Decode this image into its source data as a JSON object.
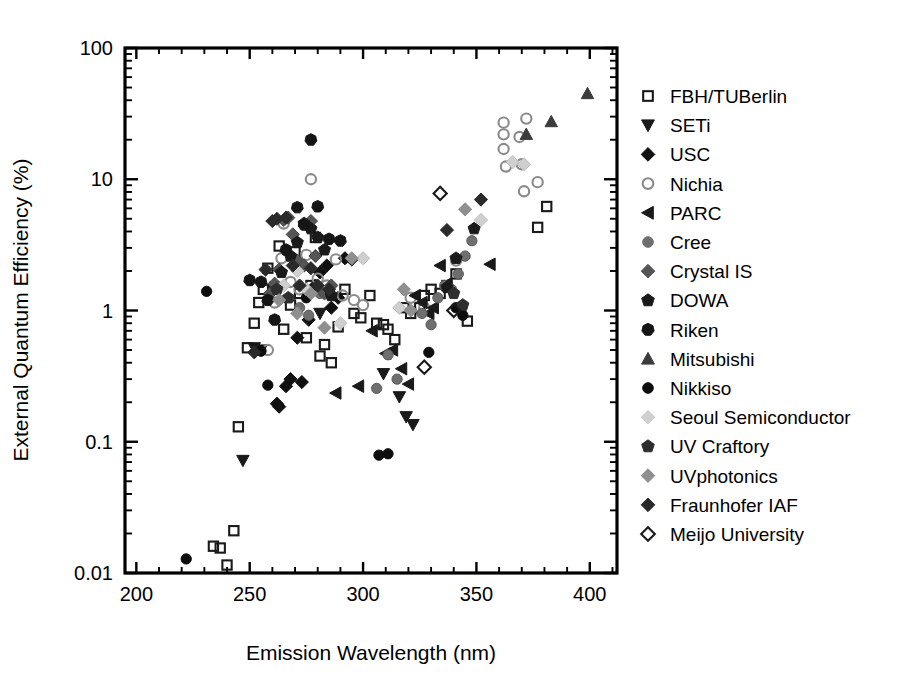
{
  "chart_data": {
    "type": "scatter",
    "title": "",
    "xlabel": "Emission Wavelength (nm)",
    "ylabel": "External Quantum Efficiency (%)",
    "xlim": [
      195,
      412
    ],
    "ylim": [
      0.01,
      100
    ],
    "yscale": "log",
    "xscale": "linear",
    "xticks": [
      200,
      250,
      300,
      350,
      400
    ],
    "xticklabels": [
      "200",
      "250",
      "300",
      "350",
      "400"
    ],
    "yticks": [
      0.01,
      0.1,
      1,
      10,
      100
    ],
    "yticklabels": [
      "0.01",
      "0.1",
      "1",
      "10",
      "100"
    ],
    "grid": false,
    "legend_position": "right-outside",
    "series": [
      {
        "name": "FBH/TUBerlin",
        "marker": "square-open",
        "fill": "none",
        "stroke": "#1a1a1a",
        "points": [
          [
            234,
            0.016
          ],
          [
            237,
            0.0155
          ],
          [
            240,
            0.0115
          ],
          [
            243,
            0.021
          ],
          [
            245,
            0.13
          ],
          [
            249,
            0.52
          ],
          [
            252,
            0.8
          ],
          [
            254,
            1.15
          ],
          [
            256,
            1.45
          ],
          [
            258,
            2.1
          ],
          [
            261,
            1.5
          ],
          [
            263,
            3.1
          ],
          [
            265,
            0.72
          ],
          [
            268,
            1.1
          ],
          [
            270,
            2.8
          ],
          [
            272,
            1.35
          ],
          [
            275,
            0.62
          ],
          [
            277,
            1.55
          ],
          [
            279,
            3.6
          ],
          [
            281,
            0.45
          ],
          [
            283,
            0.55
          ],
          [
            286,
            0.4
          ],
          [
            289,
            0.75
          ],
          [
            292,
            1.45
          ],
          [
            296,
            0.95
          ],
          [
            299,
            0.88
          ],
          [
            303,
            1.3
          ],
          [
            306,
            0.8
          ],
          [
            309,
            0.78
          ],
          [
            311,
            0.72
          ],
          [
            314,
            0.6
          ],
          [
            318,
            1.05
          ],
          [
            321,
            0.95
          ],
          [
            325,
            1.05
          ],
          [
            327,
            1.3
          ],
          [
            330,
            1.45
          ],
          [
            334,
            1.35
          ],
          [
            337,
            1.55
          ],
          [
            341,
            1.9
          ],
          [
            346,
            0.83
          ],
          [
            377,
            4.3
          ],
          [
            381,
            6.2
          ]
        ]
      },
      {
        "name": "SETi",
        "marker": "triangle-down",
        "fill": "#1a1a1a",
        "stroke": "#1a1a1a",
        "points": [
          [
            247,
            0.072
          ],
          [
            252,
            0.52
          ],
          [
            255,
            0.5
          ],
          [
            281,
            0.95
          ],
          [
            309,
            0.33
          ],
          [
            316,
            0.22
          ],
          [
            319,
            0.155
          ],
          [
            322,
            0.135
          ]
        ]
      },
      {
        "name": "USC",
        "marker": "diamond",
        "fill": "#111111",
        "stroke": "#111111",
        "points": [
          [
            262,
            0.195
          ],
          [
            263,
            0.185
          ],
          [
            266,
            0.265
          ],
          [
            268,
            0.3
          ],
          [
            271,
            0.62
          ],
          [
            273,
            0.285
          ],
          [
            276,
            0.85
          ],
          [
            279,
            1.55
          ],
          [
            281,
            1.95
          ],
          [
            284,
            2.2
          ],
          [
            286,
            1.05
          ],
          [
            289,
            1.25
          ],
          [
            292,
            2.5
          ],
          [
            295,
            2.45
          ]
        ]
      },
      {
        "name": "Nichia",
        "marker": "circle-open",
        "fill": "none",
        "stroke": "#8a8a8a",
        "points": [
          [
            258,
            0.5
          ],
          [
            261,
            1.15
          ],
          [
            264,
            2.5
          ],
          [
            265,
            4.6
          ],
          [
            268,
            1.65
          ],
          [
            272,
            1.45
          ],
          [
            275,
            2.65
          ],
          [
            277,
            10.0
          ],
          [
            280,
            1.75
          ],
          [
            284,
            1.55
          ],
          [
            288,
            2.45
          ],
          [
            291,
            1.3
          ],
          [
            296,
            1.2
          ],
          [
            300,
            1.1
          ],
          [
            321,
            1.25
          ],
          [
            327,
            1.05
          ],
          [
            341,
            2.4
          ],
          [
            362,
            17.0
          ],
          [
            362,
            22.0
          ],
          [
            362,
            27.0
          ],
          [
            363,
            12.5
          ],
          [
            369,
            21.0
          ],
          [
            370,
            13.0
          ],
          [
            372,
            29.0
          ],
          [
            371,
            8.1
          ],
          [
            377,
            9.5
          ]
        ]
      },
      {
        "name": "PARC",
        "marker": "triangle-left",
        "fill": "#1a1a1a",
        "stroke": "#1a1a1a",
        "points": [
          [
            288,
            0.235
          ],
          [
            298,
            0.265
          ],
          [
            304,
            0.7
          ],
          [
            310,
            0.47
          ],
          [
            313,
            0.5
          ],
          [
            317,
            0.36
          ],
          [
            320,
            0.275
          ],
          [
            323,
            1.3
          ],
          [
            326,
            1.15
          ],
          [
            329,
            0.95
          ],
          [
            331,
            1.05
          ],
          [
            334,
            2.2
          ],
          [
            337,
            1.6
          ],
          [
            343,
            1.05
          ],
          [
            356,
            2.25
          ]
        ]
      },
      {
        "name": "Cree",
        "marker": "circle",
        "fill": "#6e6e6e",
        "stroke": "#5a5a5a",
        "points": [
          [
            272,
            1.05
          ],
          [
            276,
            0.92
          ],
          [
            281,
            1.35
          ],
          [
            306,
            0.255
          ],
          [
            311,
            0.46
          ],
          [
            315,
            0.3
          ],
          [
            326,
            0.95
          ],
          [
            330,
            0.78
          ],
          [
            333,
            1.25
          ],
          [
            336,
            1.55
          ],
          [
            339,
            1.45
          ],
          [
            342,
            1.9
          ],
          [
            345,
            2.6
          ],
          [
            348,
            3.4
          ]
        ]
      },
      {
        "name": "Crystal IS",
        "marker": "diamond",
        "fill": "#555555",
        "stroke": "#444444",
        "points": [
          [
            259,
            1.35
          ],
          [
            261,
            1.6
          ],
          [
            263,
            2.05
          ],
          [
            265,
            4.9
          ],
          [
            267,
            5.1
          ],
          [
            269,
            3.8
          ],
          [
            271,
            2.4
          ],
          [
            274,
            2.2
          ],
          [
            277,
            4.8
          ],
          [
            279,
            2.6
          ],
          [
            283,
            1.35
          ],
          [
            286,
            1.55
          ]
        ]
      },
      {
        "name": "DOWA",
        "marker": "pentagon",
        "fill": "#1a1a1a",
        "stroke": "#1a1a1a",
        "points": [
          [
            264,
            1.95
          ],
          [
            268,
            2.6
          ],
          [
            271,
            3.3
          ],
          [
            274,
            4.6
          ],
          [
            277,
            4.2
          ],
          [
            280,
            3.6
          ],
          [
            283,
            2.9
          ],
          [
            286,
            1.3
          ],
          [
            337,
            1.5
          ],
          [
            341,
            2.5
          ],
          [
            349,
            4.2
          ]
        ]
      },
      {
        "name": "Riken",
        "marker": "heptagon",
        "fill": "#151515",
        "stroke": "#151515",
        "points": [
          [
            250,
            1.7
          ],
          [
            255,
            1.65
          ],
          [
            258,
            1.2
          ],
          [
            261,
            0.85
          ],
          [
            266,
            2.9
          ],
          [
            271,
            6.1
          ],
          [
            274,
            4.5
          ],
          [
            277,
            20.0
          ],
          [
            280,
            6.2
          ],
          [
            285,
            3.5
          ],
          [
            290,
            3.4
          ]
        ]
      },
      {
        "name": "Mitsubishi",
        "marker": "triangle-up",
        "fill": "#3c3c3c",
        "stroke": "#3c3c3c",
        "points": [
          [
            372,
            22.0
          ],
          [
            383,
            27.5
          ],
          [
            399,
            45.0
          ]
        ]
      },
      {
        "name": "Nikkiso",
        "marker": "circle",
        "fill": "#0d0d0d",
        "stroke": "#0d0d0d",
        "points": [
          [
            222,
            0.0128
          ],
          [
            231,
            1.4
          ],
          [
            255,
            0.49
          ],
          [
            258,
            0.27
          ],
          [
            262,
            1.45
          ],
          [
            275,
            1.25
          ],
          [
            307,
            0.079
          ],
          [
            311,
            0.081
          ],
          [
            329,
            0.48
          ],
          [
            341,
            1.05
          ],
          [
            344,
            0.92
          ]
        ]
      },
      {
        "name": "Seoul Semiconductor",
        "marker": "diamond",
        "fill": "#cfcfcf",
        "stroke": "#bdbdbd",
        "points": [
          [
            265,
            1.55
          ],
          [
            271,
            2.0
          ],
          [
            275,
            1.45
          ],
          [
            290,
            0.8
          ],
          [
            300,
            2.5
          ],
          [
            316,
            1.05
          ],
          [
            352,
            4.9
          ],
          [
            366,
            13.5
          ],
          [
            371,
            13.0
          ]
        ]
      },
      {
        "name": "UV Craftory",
        "marker": "pentagon",
        "fill": "#2e2e2e",
        "stroke": "#2e2e2e",
        "points": [
          [
            262,
            1.45
          ],
          [
            267,
            1.25
          ],
          [
            340,
            1.35
          ],
          [
            344,
            1.1
          ]
        ]
      },
      {
        "name": "UVphotonics",
        "marker": "diamond",
        "fill": "#8f8f8f",
        "stroke": "#8f8f8f",
        "points": [
          [
            263,
            1.2
          ],
          [
            271,
            0.95
          ],
          [
            277,
            1.35
          ],
          [
            283,
            0.74
          ],
          [
            295,
            2.5
          ],
          [
            318,
            1.45
          ],
          [
            321,
            1.0
          ],
          [
            345,
            5.9
          ]
        ]
      },
      {
        "name": "Fraunhofer IAF",
        "marker": "diamond",
        "fill": "#2a2a2a",
        "stroke": "#2a2a2a",
        "points": [
          [
            252,
            0.48
          ],
          [
            257,
            2.05
          ],
          [
            260,
            4.8
          ],
          [
            262,
            5.0
          ],
          [
            266,
            5.1
          ],
          [
            269,
            2.2
          ],
          [
            272,
            1.55
          ],
          [
            277,
            2.1
          ],
          [
            280,
            1.55
          ],
          [
            285,
            1.45
          ],
          [
            337,
            4.1
          ],
          [
            352,
            7.0
          ]
        ]
      },
      {
        "name": "Meijo University",
        "marker": "diamond-open",
        "fill": "none",
        "stroke": "#1a1a1a",
        "points": [
          [
            327,
            0.37
          ],
          [
            334,
            7.8
          ],
          [
            340,
            1.0
          ]
        ]
      }
    ]
  },
  "legend": {
    "items": [
      {
        "label": "FBH/TUBerlin",
        "marker": "square-open",
        "fill": "none",
        "stroke": "#1a1a1a"
      },
      {
        "label": "SETi",
        "marker": "triangle-down",
        "fill": "#1a1a1a",
        "stroke": "#1a1a1a"
      },
      {
        "label": "USC",
        "marker": "diamond",
        "fill": "#111111",
        "stroke": "#111111"
      },
      {
        "label": "Nichia",
        "marker": "circle-open",
        "fill": "none",
        "stroke": "#8a8a8a"
      },
      {
        "label": "PARC",
        "marker": "triangle-left",
        "fill": "#1a1a1a",
        "stroke": "#1a1a1a"
      },
      {
        "label": "Cree",
        "marker": "circle",
        "fill": "#6e6e6e",
        "stroke": "#6e6e6e"
      },
      {
        "label": "Crystal IS",
        "marker": "diamond",
        "fill": "#555555",
        "stroke": "#555555"
      },
      {
        "label": "DOWA",
        "marker": "pentagon",
        "fill": "#1a1a1a",
        "stroke": "#1a1a1a"
      },
      {
        "label": "Riken",
        "marker": "heptagon",
        "fill": "#151515",
        "stroke": "#151515"
      },
      {
        "label": "Mitsubishi",
        "marker": "triangle-up",
        "fill": "#3c3c3c",
        "stroke": "#3c3c3c"
      },
      {
        "label": "Nikkiso",
        "marker": "circle",
        "fill": "#0d0d0d",
        "stroke": "#0d0d0d"
      },
      {
        "label": "Seoul Semiconductor",
        "marker": "diamond",
        "fill": "#cfcfcf",
        "stroke": "#cfcfcf"
      },
      {
        "label": "UV Craftory",
        "marker": "pentagon",
        "fill": "#2e2e2e",
        "stroke": "#2e2e2e"
      },
      {
        "label": "UVphotonics",
        "marker": "diamond",
        "fill": "#8f8f8f",
        "stroke": "#8f8f8f"
      },
      {
        "label": "Fraunhofer IAF",
        "marker": "diamond",
        "fill": "#2a2a2a",
        "stroke": "#2a2a2a"
      },
      {
        "label": "Meijo University",
        "marker": "diamond-open",
        "fill": "none",
        "stroke": "#1a1a1a"
      }
    ]
  }
}
